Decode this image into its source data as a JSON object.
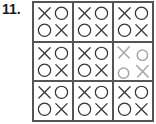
{
  "problem": {
    "number": "11."
  },
  "grid": {
    "rows": 3,
    "cols": 3,
    "cells": [
      {
        "pattern": [
          [
            "X",
            "O"
          ],
          [
            "O",
            "X"
          ]
        ],
        "style": "printed"
      },
      {
        "pattern": [
          [
            "X",
            "O"
          ],
          [
            "O",
            "X"
          ]
        ],
        "style": "printed"
      },
      {
        "pattern": [
          [
            "X",
            "O"
          ],
          [
            "O",
            "X"
          ]
        ],
        "style": "printed"
      },
      {
        "pattern": [
          [
            "X",
            "O"
          ],
          [
            "O",
            "X"
          ]
        ],
        "style": "printed"
      },
      {
        "pattern": [
          [
            "X",
            "O"
          ],
          [
            "O",
            "X"
          ]
        ],
        "style": "printed"
      },
      {
        "pattern": [
          [
            "X",
            "O"
          ],
          [
            "O",
            "X"
          ]
        ],
        "style": "handwritten-faint"
      },
      {
        "pattern": [
          [
            "X",
            "O"
          ],
          [
            "O",
            "X"
          ]
        ],
        "style": "printed"
      },
      {
        "pattern": [
          [
            "X",
            "O"
          ],
          [
            "O",
            "X"
          ]
        ],
        "style": "printed"
      },
      {
        "pattern": [
          [
            "X",
            "O"
          ],
          [
            "O",
            "X"
          ]
        ],
        "style": "printed"
      }
    ]
  },
  "colors": {
    "printed": "#333333",
    "faint": "#a8a8a8",
    "border": "#555555"
  }
}
